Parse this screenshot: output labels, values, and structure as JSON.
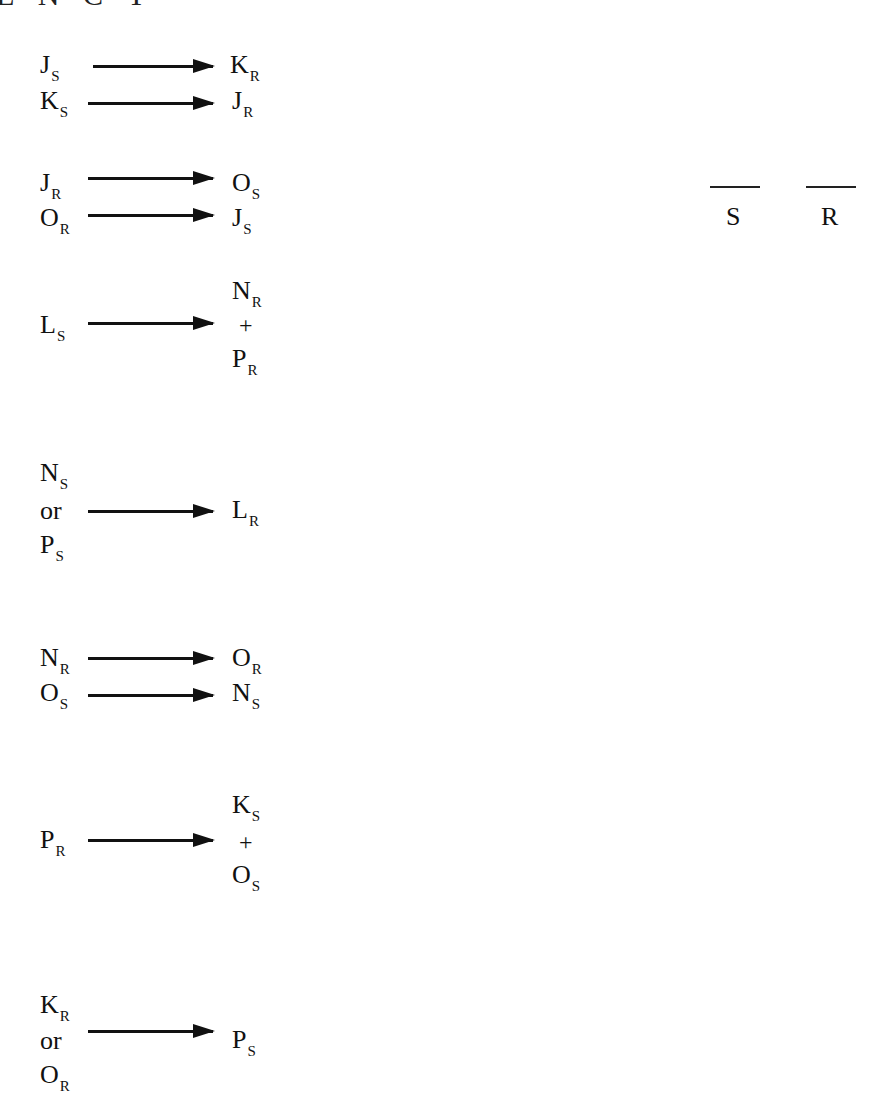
{
  "heading": "E N C Y",
  "answer_blanks": [
    {
      "label": "S"
    },
    {
      "label": "R"
    }
  ],
  "arrow_icon": "right-arrow-icon",
  "rules": [
    {
      "from": [
        {
          "letter": "J",
          "sub": "S"
        }
      ],
      "to": [
        {
          "letter": "K",
          "sub": "R"
        }
      ]
    },
    {
      "from": [
        {
          "letter": "K",
          "sub": "S"
        }
      ],
      "to": [
        {
          "letter": "J",
          "sub": "R"
        }
      ]
    },
    {
      "from": [
        {
          "letter": "J",
          "sub": "R"
        }
      ],
      "to": [
        {
          "letter": "O",
          "sub": "S"
        }
      ]
    },
    {
      "from": [
        {
          "letter": "O",
          "sub": "R"
        }
      ],
      "to": [
        {
          "letter": "J",
          "sub": "S"
        }
      ]
    },
    {
      "from": [
        {
          "letter": "L",
          "sub": "S"
        }
      ],
      "to": [
        {
          "letter": "N",
          "sub": "R"
        },
        {
          "letter": "P",
          "sub": "R"
        }
      ],
      "to_join": "+"
    },
    {
      "from": [
        {
          "letter": "N",
          "sub": "S"
        },
        {
          "letter": "P",
          "sub": "S"
        }
      ],
      "from_join": "or",
      "to": [
        {
          "letter": "L",
          "sub": "R"
        }
      ]
    },
    {
      "from": [
        {
          "letter": "N",
          "sub": "R"
        }
      ],
      "to": [
        {
          "letter": "O",
          "sub": "R"
        }
      ]
    },
    {
      "from": [
        {
          "letter": "O",
          "sub": "S"
        }
      ],
      "to": [
        {
          "letter": "N",
          "sub": "S"
        }
      ]
    },
    {
      "from": [
        {
          "letter": "P",
          "sub": "R"
        }
      ],
      "to": [
        {
          "letter": "K",
          "sub": "S"
        },
        {
          "letter": "O",
          "sub": "S"
        }
      ],
      "to_join": "+"
    },
    {
      "from": [
        {
          "letter": "K",
          "sub": "R"
        },
        {
          "letter": "O",
          "sub": "R"
        }
      ],
      "from_join": "or",
      "to": [
        {
          "letter": "P",
          "sub": "S"
        }
      ]
    }
  ]
}
